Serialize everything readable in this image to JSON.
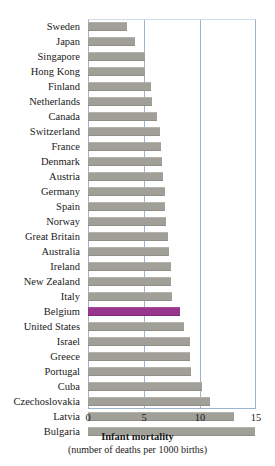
{
  "chart_data": {
    "type": "bar",
    "orientation": "horizontal",
    "title": "Infant mortality",
    "subtitle": "(number of deaths per 1000 births)",
    "xlabel": "Infant mortality",
    "ylabel": "",
    "xlim": [
      0,
      15
    ],
    "xticks": [
      0,
      5,
      10,
      15
    ],
    "xtick_labels": [
      "0",
      "5",
      "10",
      "15"
    ],
    "grid": true,
    "grid_axis": "x",
    "legend": false,
    "highlight_category": "Belgium",
    "colors": {
      "bar": "#a0a098",
      "highlight": "#97368c",
      "grid": "#9ab4cf",
      "axis": "#9ab4cf",
      "text": "#1a1a1a",
      "background": "#ffffff"
    },
    "categories": [
      "Sweden",
      "Japan",
      "Singapore",
      "Hong Kong",
      "Finland",
      "Netherlands",
      "Canada",
      "Switzerland",
      "France",
      "Denmark",
      "Austria",
      "Germany",
      "Spain",
      "Norway",
      "Great Britain",
      "Australia",
      "Ireland",
      "New Zealand",
      "Italy",
      "Belgium",
      "United States",
      "Israel",
      "Greece",
      "Portugal",
      "Cuba",
      "Czechoslovakia",
      "Latvia",
      "Bulgaria"
    ],
    "values": [
      3.5,
      4.2,
      5.1,
      5.1,
      5.6,
      5.7,
      6.2,
      6.4,
      6.5,
      6.6,
      6.7,
      6.9,
      6.9,
      7.0,
      7.1,
      7.2,
      7.4,
      7.4,
      7.5,
      8.2,
      8.6,
      9.1,
      9.1,
      9.2,
      10.2,
      10.9,
      13.0,
      14.9
    ]
  }
}
